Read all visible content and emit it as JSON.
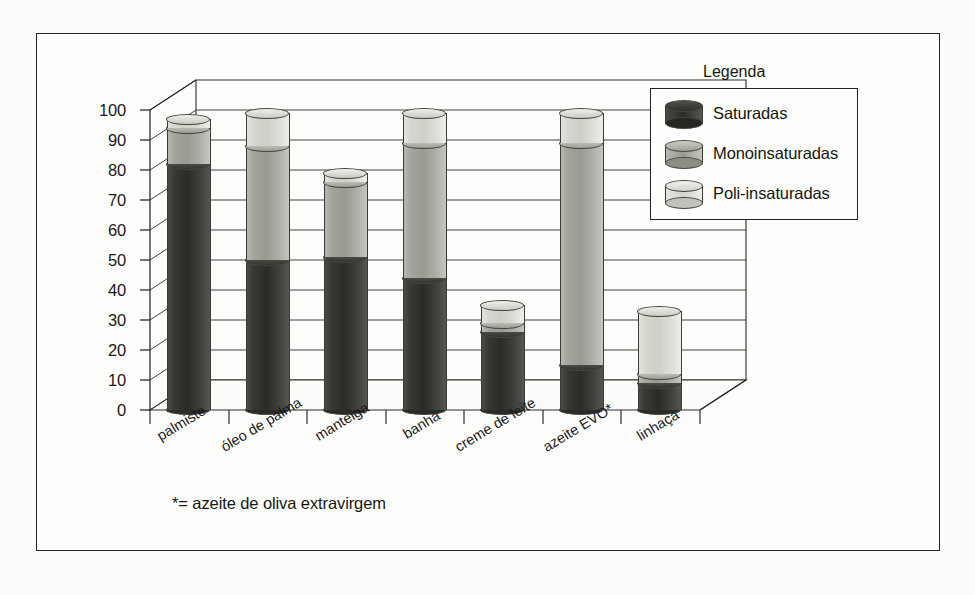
{
  "figure": {
    "footnote": "*= azeite de oliva extravirgem"
  },
  "legend": {
    "title": "Legenda",
    "items": [
      {
        "label": "Saturadas",
        "color": "#2b2b28",
        "key": "sat"
      },
      {
        "label": "Monoinsaturadas",
        "color": "#9a9a93",
        "key": "mono"
      },
      {
        "label": "Poli-insaturadas",
        "color": "#d3d3cc",
        "key": "poli"
      }
    ]
  },
  "chart_data": {
    "type": "bar",
    "stacked": true,
    "title": "",
    "subtitle": "",
    "xlabel": "",
    "ylabel": "",
    "ylim": [
      0,
      100
    ],
    "yticks": [
      0,
      10,
      20,
      30,
      40,
      50,
      60,
      70,
      80,
      90,
      100
    ],
    "ytick_labels": [
      "0",
      "10",
      "20",
      "30",
      "40",
      "50",
      "60",
      "70",
      "80",
      "90",
      "100"
    ],
    "grid": true,
    "legend_position": "top-right",
    "annotations": [
      "*= azeite de oliva extravirgem"
    ],
    "categories": [
      "palmiste",
      "óleo de palma",
      "manteiga",
      "banha",
      "creme de leite",
      "azeite EVO*",
      "linhaça"
    ],
    "series": [
      {
        "name": "Saturadas",
        "color": "#2b2b28",
        "values": [
          82,
          50,
          51,
          44,
          26,
          15,
          9
        ]
      },
      {
        "name": "Monoinsaturadas",
        "color": "#9a9a93",
        "values": [
          12,
          38,
          25,
          45,
          3,
          74,
          3
        ]
      },
      {
        "name": "Poli-insaturadas",
        "color": "#d3d3cc",
        "values": [
          3,
          11,
          3,
          10,
          6,
          10,
          21
        ]
      }
    ],
    "cumulative_tops": [
      [
        82,
        94,
        97
      ],
      [
        50,
        88,
        99
      ],
      [
        51,
        76,
        79
      ],
      [
        44,
        89,
        99
      ],
      [
        26,
        29,
        35
      ],
      [
        15,
        89,
        99
      ],
      [
        9,
        12,
        33
      ]
    ]
  }
}
